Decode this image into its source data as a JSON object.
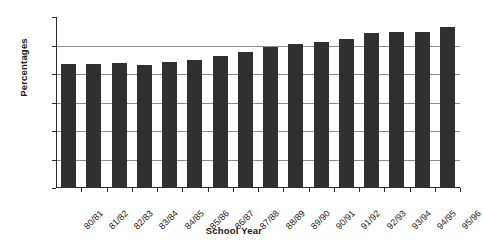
{
  "chart_data": {
    "type": "bar",
    "title": "",
    "xlabel": "School Year",
    "ylabel": "Percentages",
    "categories": [
      "80/81",
      "81/82",
      "82/83",
      "83/84",
      "84/85",
      "85/86",
      "86/87",
      "87/88",
      "88/89",
      "89/90",
      "90/91",
      "91/92",
      "92/93",
      "93/94",
      "94/95",
      "95/96"
    ],
    "values": [
      4.3,
      4.3,
      4.35,
      4.28,
      4.4,
      4.45,
      4.6,
      4.75,
      4.9,
      5.0,
      5.1,
      5.2,
      5.4,
      5.45,
      5.45,
      5.6
    ],
    "ylim": [
      0.0,
      6.0
    ],
    "ytick_labels": [
      "6.0",
      "5.0",
      "4.0",
      "3.0",
      "2.0",
      "1.0",
      "0.0"
    ],
    "ytick_values": [
      6.0,
      5.0,
      4.0,
      3.0,
      2.0,
      1.0,
      0.0
    ],
    "grid": true,
    "legend": "none",
    "bar_color": "#303030",
    "grid_color": "#8d8d8d",
    "axis_color": "#2b2b2b"
  }
}
